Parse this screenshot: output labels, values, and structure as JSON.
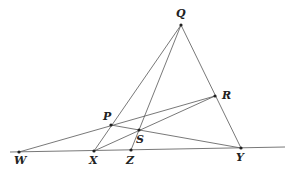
{
  "diagram": {
    "points": {
      "Q": {
        "label": "Q",
        "x": 181,
        "y": 25,
        "lx": 176,
        "ly": 17
      },
      "R": {
        "label": "R",
        "x": 215,
        "y": 96,
        "lx": 222,
        "ly": 99
      },
      "P": {
        "label": "P",
        "x": 111,
        "y": 125,
        "lx": 103,
        "ly": 120
      },
      "S": {
        "label": "S",
        "x": 139,
        "y": 130,
        "lx": 136,
        "ly": 143
      },
      "W": {
        "label": "W",
        "x": 19,
        "y": 152,
        "lx": 14,
        "ly": 164
      },
      "X": {
        "label": "X",
        "x": 94,
        "y": 151,
        "lx": 89,
        "ly": 164
      },
      "Z": {
        "label": "Z",
        "x": 131,
        "y": 150,
        "lx": 126,
        "ly": 164
      },
      "Y": {
        "label": "Y",
        "x": 241,
        "y": 148,
        "lx": 236,
        "ly": 161
      }
    },
    "baseline": {
      "x1": 10,
      "y1": 152,
      "x2": 285,
      "y2": 147
    },
    "segments": [
      {
        "from": "Q",
        "to": "X"
      },
      {
        "from": "Q",
        "to": "Z"
      },
      {
        "from": "Q",
        "to": "Y"
      },
      {
        "from": "W",
        "to": "R"
      },
      {
        "from": "X",
        "to": "R"
      },
      {
        "from": "P",
        "to": "Y"
      }
    ]
  }
}
